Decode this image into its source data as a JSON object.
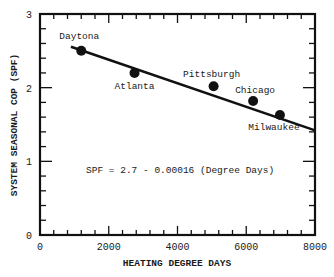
{
  "chart_data": {
    "type": "scatter",
    "title": "",
    "xlabel": "HEATING DEGREE DAYS",
    "ylabel": "SYSTEM SEASONAL COP (SPF)",
    "xlim": [
      0,
      8000
    ],
    "ylim": [
      0,
      3
    ],
    "x_ticks": [
      0,
      2000,
      4000,
      6000,
      8000
    ],
    "x_tick_labels": [
      "0",
      "2000",
      "4000",
      "6000",
      "8000"
    ],
    "y_ticks": [
      0,
      1,
      2,
      3
    ],
    "y_tick_labels": [
      "0",
      "1",
      "2",
      "3"
    ],
    "x_minor_step": 400,
    "y_minor_step": 0.2,
    "grid": false,
    "series": [
      {
        "name": "Cities",
        "points": [
          {
            "label": "Daytona",
            "x": 1200,
            "y": 2.5
          },
          {
            "label": "Atlanta",
            "x": 2750,
            "y": 2.2
          },
          {
            "label": "Pittsburgh",
            "x": 5050,
            "y": 2.02
          },
          {
            "label": "Chicago",
            "x": 6200,
            "y": 1.82
          },
          {
            "label": "Milwaukee",
            "x": 6980,
            "y": 1.63
          }
        ]
      }
    ],
    "fit_line": {
      "equation": "SPF = 2.7 - 0.00016 (Degree Days)",
      "intercept": 2.7,
      "slope": -0.00016,
      "x_start": 900,
      "x_end": 8000
    },
    "annotations": [
      "SPF = 2.7 - 0.00016 (Degree Days)"
    ]
  }
}
